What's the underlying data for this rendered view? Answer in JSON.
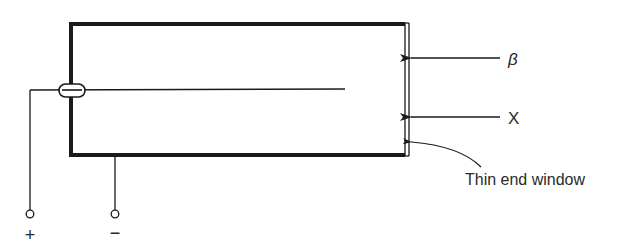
{
  "diagram": {
    "labels": {
      "beta": "β",
      "xray": "X",
      "window": "Thin end window",
      "plus": "+",
      "minus": "−"
    },
    "colors": {
      "line": "#1a1a1a",
      "text": "#2a2a2a",
      "background": "#ffffff"
    }
  }
}
